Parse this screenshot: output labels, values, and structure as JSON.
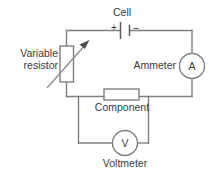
{
  "figure": {
    "type": "electrical-circuit-schematic",
    "background_color": "#ffffff",
    "line_color": "#808080",
    "text_color": "#3b3b3b"
  },
  "labels": {
    "cell": "Cell",
    "variable_resistor": "Variable\nresistor",
    "ammeter": "Ammeter",
    "component": "Component",
    "voltmeter": "Voltmeter"
  },
  "meters": {
    "ammeter_symbol": "A",
    "voltmeter_symbol": "V"
  },
  "polarity": {
    "positive": "+",
    "negative": "–"
  },
  "components": [
    {
      "name": "cell",
      "label": "Cell",
      "symbol": "battery-cell",
      "position": "top-branch"
    },
    {
      "name": "variable-resistor",
      "label": "Variable resistor",
      "symbol": "resistor-with-arrow",
      "position": "left-branch"
    },
    {
      "name": "ammeter",
      "label": "Ammeter",
      "symbol": "A",
      "position": "right-branch"
    },
    {
      "name": "component",
      "label": "Component",
      "symbol": "resistor-box",
      "position": "bottom-branch"
    },
    {
      "name": "voltmeter",
      "label": "Voltmeter",
      "symbol": "V",
      "position": "parallel-branch"
    }
  ]
}
